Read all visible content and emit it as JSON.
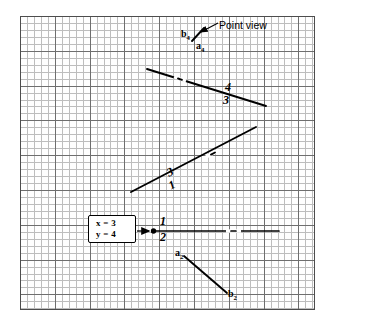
{
  "figure": {
    "type": "descriptive-geometry-point-view-construction",
    "paper": {
      "background_color": "#ffffff",
      "grid_minor_color": "#bdbdbd",
      "grid_major_color": "#6e6e6e",
      "line_color": "#000000"
    }
  },
  "annotations": {
    "point_view_label": "Point view",
    "label_b4": "b",
    "label_b4_sub": "4",
    "label_a4": "a",
    "label_a4_sub": "4",
    "fold_top_upper": "4",
    "fold_top_lower": "3",
    "fold_mid_upper": "3",
    "fold_mid_lower": "1",
    "fold_horiz_upper": "1",
    "fold_horiz_lower": "2",
    "label_a2": "a",
    "label_a2_sub": "2",
    "label_b2": "b",
    "label_b2_sub": "2"
  },
  "value_box": {
    "line1": "x = 3",
    "line2": "y = 4"
  },
  "geometry": {
    "fold_line_4_3": {
      "x1": 147,
      "y1": 69,
      "x2": 266,
      "y2": 106
    },
    "fold_line_3_1": {
      "x1": 131,
      "y1": 192,
      "x2": 256,
      "y2": 127
    },
    "fold_line_1_2": {
      "x1": 152,
      "y1": 231,
      "x2": 279,
      "y2": 231
    },
    "line_a2_b2": {
      "x1": 184,
      "y1": 256,
      "x2": 227,
      "y2": 293
    },
    "point_view_tick": {
      "x1": 192,
      "y1": 41,
      "x2": 203,
      "y2": 29
    },
    "callout_arrow": {
      "x1": 138,
      "y1": 231,
      "x2": 151,
      "y2": 231
    },
    "point_marker": {
      "cx": 153,
      "cy": 231,
      "r": 2.6
    },
    "point_view_leader": {
      "x1": 217,
      "y1": 23,
      "x2": 202,
      "y2": 32
    }
  }
}
